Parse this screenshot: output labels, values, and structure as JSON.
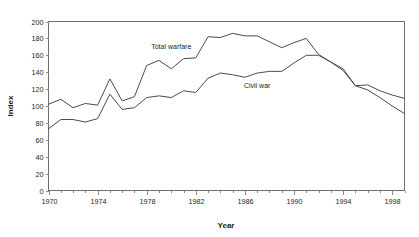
{
  "chart_data": {
    "type": "line",
    "title": "",
    "xlabel": "Year",
    "ylabel": "Index",
    "xlim": [
      1970,
      1999
    ],
    "ylim": [
      0,
      200
    ],
    "ytick_step": 20,
    "xtick_step": 4,
    "xminor_tick_step": 1,
    "grid": false,
    "legend": "inline-labels",
    "x": [
      1970,
      1971,
      1972,
      1973,
      1974,
      1975,
      1976,
      1977,
      1978,
      1979,
      1980,
      1981,
      1982,
      1983,
      1984,
      1985,
      1986,
      1987,
      1988,
      1989,
      1990,
      1991,
      1992,
      1993,
      1994,
      1995,
      1996,
      1997,
      1998,
      1999
    ],
    "xticklabels": [
      "1970",
      "1974",
      "1978",
      "1982",
      "1986",
      "1990",
      "1994",
      "1998"
    ],
    "yticklabels": [
      "0",
      "20",
      "40",
      "60",
      "80",
      "100",
      "120",
      "140",
      "160",
      "180",
      "200"
    ],
    "series": [
      {
        "name": "Total warfare",
        "label_x": 1980,
        "label_y": 168,
        "values": [
          102,
          108,
          98,
          103,
          101,
          132,
          106,
          111,
          148,
          154,
          144,
          156,
          157,
          182,
          181,
          186,
          183,
          183,
          176,
          169,
          175,
          180,
          161,
          152,
          144,
          124,
          125,
          118,
          113,
          109
        ]
      },
      {
        "name": "Civil war",
        "label_x": 1987,
        "label_y": 121,
        "values": [
          73,
          84,
          84,
          81,
          85,
          114,
          96,
          98,
          110,
          112,
          110,
          118,
          116,
          133,
          139,
          137,
          134,
          139,
          141,
          141,
          151,
          160,
          160,
          152,
          142,
          124,
          119,
          110,
          100,
          91
        ]
      }
    ]
  },
  "axes": {
    "x_title": "Year",
    "y_title": "Index"
  }
}
